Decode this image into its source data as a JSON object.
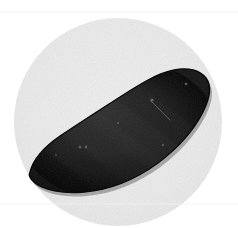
{
  "image": {
    "domain": "Natural-Image",
    "title": "Dark elongated specimen on light circular plate",
    "width": 238,
    "height": 228,
    "background_color": "#ffffff",
    "description": "Photograph of a single dark, elongated, curved specimen resembling a sweet potato or eggplant, resting on a pale gray circular plate against a white background."
  },
  "plate": {
    "name": "circular-plate",
    "shape": "circle",
    "center_x": 118,
    "center_y": 122,
    "radius": 104,
    "fill_color": "#ebebeb",
    "edge_color": "#e4e4e4"
  },
  "scan_lines": [
    {
      "name": "upper-scan-line",
      "y": 12,
      "color": "#f0f0f0",
      "opacity": 0.9
    },
    {
      "name": "lower-scan-line",
      "y": 204,
      "color": "#f2f2f2",
      "opacity": 0.85
    }
  ],
  "specimen": {
    "name": "dark-elongated-specimen",
    "fill_color": "#181818",
    "outline_color": "#0a0a0a",
    "highlight_color": "#4a4a4a",
    "shadow_color": "#050505",
    "bounding_box": {
      "x": 28,
      "y": 68,
      "width": 182,
      "height": 124
    },
    "orientation": "diagonal, low-left to high-right",
    "path": "M 30 172 C 33 160 44 147 60 136 C 78 124 98 111 120 97 C 140 84 158 73 174 70 C 188 67 200 70 206 78 C 212 86 210 98 203 112 C 194 130 178 148 158 163 C 136 179 110 190 84 192 C 62 194 44 190 35 183 C 30 179 28 176 30 172 Z"
  },
  "specimen_marks": [
    {
      "name": "speck-upper-right",
      "cx": 186,
      "cy": 84,
      "r": 1.3,
      "color": "#6a6a6a"
    },
    {
      "name": "speck-mid-upper",
      "cx": 152,
      "cy": 100,
      "r": 1.6,
      "color": "#707070"
    },
    {
      "name": "speck-center",
      "cx": 118,
      "cy": 123,
      "r": 1.2,
      "color": "#5c5c5c"
    },
    {
      "name": "speck-left-upper",
      "cx": 118,
      "cy": 123,
      "r": 1.0,
      "color": "#585858"
    },
    {
      "name": "speck-lower-left-a",
      "cx": 80,
      "cy": 147,
      "r": 1.5,
      "color": "#636363"
    },
    {
      "name": "speck-lower-left-b",
      "cx": 86,
      "cy": 147,
      "r": 1.4,
      "color": "#636363"
    },
    {
      "name": "speck-far-left",
      "cx": 56,
      "cy": 155,
      "r": 1.1,
      "color": "#555555"
    },
    {
      "name": "speck-right-mid",
      "cx": 163,
      "cy": 145,
      "r": 1.2,
      "color": "#5a5a5a"
    },
    {
      "name": "scratch-streak",
      "x1": 151,
      "y1": 101,
      "x2": 170,
      "y2": 120,
      "color": "#8a8a8a"
    }
  ],
  "a11y": {
    "alt_text": "A dark elongated curved specimen photographed on a pale gray circular plate."
  }
}
